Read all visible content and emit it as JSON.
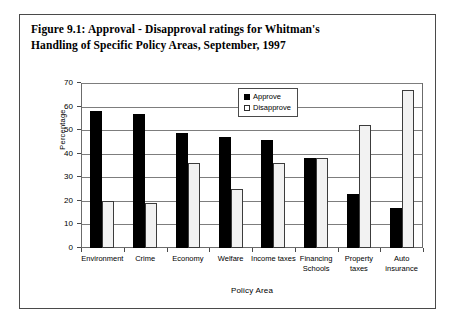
{
  "figure": {
    "title_line1": "Figure 9.1: Approval - Disapproval ratings for Whitman's",
    "title_line2": "Handling of Specific Policy Areas, September, 1997"
  },
  "legend": {
    "position": "inside-top-right",
    "entries": [
      {
        "label": "Approve",
        "swatch": "filled-black-square",
        "color": "#000000"
      },
      {
        "label": "Disapprove",
        "swatch": "open-white-square",
        "color": "#ffffff"
      }
    ]
  },
  "chart_data": {
    "type": "bar",
    "title": "Figure 9.1: Approval - Disapproval ratings for Whitman's Handling of Specific Policy Areas, September, 1997",
    "xlabel": "Policy Area",
    "ylabel": "Percentage",
    "ylim": [
      0,
      70
    ],
    "yticks": [
      0,
      10,
      20,
      30,
      40,
      50,
      60,
      70
    ],
    "ytick_labels": [
      "0",
      "10",
      "20",
      "30",
      "40",
      "50",
      "60",
      "70"
    ],
    "grid": true,
    "legend_position": "inside top right",
    "categories": [
      "Environment",
      "Crime",
      "Economy",
      "Welfare",
      "Income taxes",
      "Financing Schools",
      "Property taxes",
      "Auto insurance"
    ],
    "category_labels": [
      [
        "Environment"
      ],
      [
        "Crime"
      ],
      [
        "Economy"
      ],
      [
        "Welfare"
      ],
      [
        "Income taxes"
      ],
      [
        "Financing",
        "Schools"
      ],
      [
        "Property",
        "taxes"
      ],
      [
        "Auto",
        "insurance"
      ]
    ],
    "series": [
      {
        "name": "Approve",
        "color": "#000000",
        "values": [
          58,
          57,
          49,
          47,
          46,
          38,
          23,
          17
        ]
      },
      {
        "name": "Disapprove",
        "color": "#f2f2f2",
        "values": [
          20,
          19,
          36,
          25,
          36,
          38,
          52,
          67
        ]
      }
    ]
  }
}
